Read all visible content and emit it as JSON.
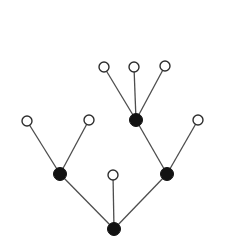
{
  "diagram": {
    "type": "tree",
    "background_color": "#ffffff",
    "edge_color": "#4d4d4d",
    "edge_width": 1.3,
    "node_styles": {
      "filled": {
        "fill": "#121212",
        "stroke": "#121212",
        "stroke_width": 1,
        "radius": 6.5
      },
      "open": {
        "fill": "#ffffff",
        "stroke": "#2e2e2e",
        "stroke_width": 1.4,
        "radius": 5
      }
    },
    "nodes": [
      {
        "id": "leaf-top-left",
        "x": 104,
        "y": 67,
        "type": "open"
      },
      {
        "id": "leaf-top-middle",
        "x": 134,
        "y": 67,
        "type": "open"
      },
      {
        "id": "leaf-top-right",
        "x": 165,
        "y": 66,
        "type": "open"
      },
      {
        "id": "internal-upper",
        "x": 136,
        "y": 120,
        "type": "filled"
      },
      {
        "id": "leaf-far-left",
        "x": 27,
        "y": 121,
        "type": "open"
      },
      {
        "id": "leaf-mid-left",
        "x": 89,
        "y": 120,
        "type": "open"
      },
      {
        "id": "leaf-far-right",
        "x": 198,
        "y": 120,
        "type": "open"
      },
      {
        "id": "internal-left",
        "x": 60,
        "y": 174,
        "type": "filled"
      },
      {
        "id": "leaf-center",
        "x": 113,
        "y": 175,
        "type": "open"
      },
      {
        "id": "internal-right",
        "x": 167,
        "y": 174,
        "type": "filled"
      },
      {
        "id": "root",
        "x": 114,
        "y": 229,
        "type": "filled"
      }
    ],
    "edges": [
      [
        "leaf-top-left",
        "internal-upper"
      ],
      [
        "leaf-top-middle",
        "internal-upper"
      ],
      [
        "leaf-top-right",
        "internal-upper"
      ],
      [
        "leaf-far-left",
        "internal-left"
      ],
      [
        "leaf-mid-left",
        "internal-left"
      ],
      [
        "internal-upper",
        "internal-right"
      ],
      [
        "leaf-far-right",
        "internal-right"
      ],
      [
        "internal-left",
        "root"
      ],
      [
        "leaf-center",
        "root"
      ],
      [
        "internal-right",
        "root"
      ]
    ],
    "canvas": {
      "width": 228,
      "height": 244
    }
  }
}
